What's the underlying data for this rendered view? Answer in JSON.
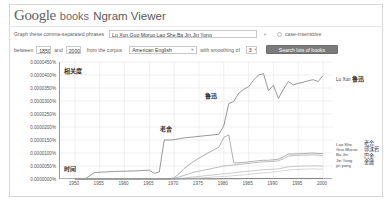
{
  "header": {
    "logo_google": "Google",
    "logo_books": "books",
    "logo_ngram": "Ngram Viewer"
  },
  "form": {
    "phrases_label": "Graph these comma-separated phrases",
    "phrases_value": "Lu Xun,Guo Moruo,Lao She,Ba Jin,Jin Yong",
    "case_insensitive_label": "case-insensitive",
    "between_label": "between",
    "year_start": "1850",
    "and_label": "and",
    "year_end": "2000",
    "corpus_label": "from the corpus",
    "corpus_value": "American English",
    "smoothing_label": "with smoothing of",
    "smoothing_value": "3",
    "search_button": "Search lots of books"
  },
  "annotations": {
    "y_axis_cn": "相关度",
    "x_axis_cn": "时间",
    "lao_she_cn": "老舍",
    "lu_xun_cn": "鲁迅"
  },
  "legend_right": {
    "top": {
      "name": "Lu Xun",
      "cn": "鲁迅"
    },
    "items": [
      {
        "name": "Lao She",
        "cn": "老舍"
      },
      {
        "name": "Guo Moruo",
        "cn": "郭沫若"
      },
      {
        "name": "Ba Jin",
        "cn": "巴金"
      },
      {
        "name": "Jin Yong",
        "cn": "金庸"
      },
      {
        "name": "jin yong",
        "cn": ""
      }
    ]
  },
  "chart_data": {
    "type": "line",
    "title": "",
    "xlabel": "时间",
    "ylabel": "相关度",
    "xlim": [
      1947,
      2002
    ],
    "ylim": [
      0.0,
      4.5e-05
    ],
    "grid": true,
    "legend_position": "right",
    "ytick_labels": [
      "0.0000450%",
      "0.0000400%",
      "0.0000350%",
      "0.0000300%",
      "0.0000250%",
      "0.0000200%",
      "0.0000150%",
      "0.0000100%",
      "0.0000050%",
      "0.0000000%"
    ],
    "ytick_values": [
      4.5e-05,
      4e-05,
      3.5e-05,
      3e-05,
      2.5e-05,
      2e-05,
      1.5e-05,
      1e-05,
      5e-06,
      0.0
    ],
    "xtick_labels": [
      "1950",
      "1955",
      "1960",
      "1965",
      "1970",
      "1975",
      "1980",
      "1985",
      "1990",
      "1995",
      "2000"
    ],
    "xtick_values": [
      1950,
      1955,
      1960,
      1965,
      1970,
      1975,
      1980,
      1985,
      1990,
      1995,
      2000
    ],
    "x": [
      1950,
      1952,
      1954,
      1955,
      1956,
      1958,
      1960,
      1962,
      1964,
      1965,
      1966,
      1967,
      1968,
      1969,
      1970,
      1971,
      1972,
      1973,
      1974,
      1975,
      1976,
      1977,
      1978,
      1979,
      1980,
      1981,
      1982,
      1983,
      1984,
      1985,
      1986,
      1987,
      1988,
      1989,
      1990,
      1991,
      1992,
      1993,
      1994,
      1995,
      1996,
      1997,
      1998,
      1999,
      2000
    ],
    "series": [
      {
        "name": "Lu Xun",
        "cn": "鲁迅",
        "color": "#6b6b6b",
        "values": [
          0.0,
          0.0,
          2.5e-06,
          2.6e-06,
          2.7e-06,
          2.9e-06,
          3e-06,
          3.1e-06,
          3.3e-06,
          3.4e-06,
          2.2e-06,
          2.7e-06,
          1.5e-05,
          1.5e-05,
          1.51e-05,
          1.55e-05,
          1.58e-05,
          1.6e-05,
          1.62e-05,
          1.64e-05,
          1.66e-05,
          1.68e-05,
          1.7e-05,
          1.72e-05,
          2.05e-05,
          2.9e-05,
          2.98e-05,
          3.3e-05,
          3.45e-05,
          3.55e-05,
          3.8e-05,
          4e-05,
          4.05e-05,
          3.4e-05,
          3.6e-05,
          3.1e-05,
          3.45e-05,
          3.75e-05,
          3.62e-05,
          3.68e-05,
          3.72e-05,
          3.78e-05,
          3.82e-05,
          3.75e-05,
          3.98e-05
        ]
      },
      {
        "name": "Lao She",
        "cn": "老舍",
        "color": "#8c8c8c",
        "values": [
          0.0,
          0.0,
          0.0,
          0.0,
          0.0,
          0.0,
          0.0,
          0.0,
          0.0,
          0.0,
          0.0,
          0.0,
          0.0,
          0.0,
          5e-07,
          2e-06,
          4e-06,
          5.5e-06,
          6.8e-06,
          8e-06,
          9.2e-06,
          1.02e-05,
          1.12e-05,
          1.22e-05,
          1.6e-05,
          1.7e-05,
          6.2e-06,
          6.2e-06,
          6.4e-06,
          6.6e-06,
          6.8e-06,
          7e-06,
          7.2e-06,
          7.2e-06,
          7.4e-06,
          7.6e-06,
          8.5e-06,
          9.6e-06,
          9.6e-06,
          9.7e-06,
          9.8e-06,
          9.9e-06,
          1e-05,
          9.8e-06,
          9.8e-06
        ]
      },
      {
        "name": "Guo Moruo",
        "cn": "郭沫若",
        "color": "#a0a0a0",
        "values": [
          0.0,
          0.0,
          0.0,
          0.0,
          0.0,
          0.0,
          0.0,
          0.0,
          0.0,
          0.0,
          0.0,
          0.0,
          0.0,
          0.0,
          2e-07,
          8e-07,
          1.4e-06,
          2e-06,
          2.6e-06,
          3e-06,
          3.4e-06,
          3.8e-06,
          4.2e-06,
          4.6e-06,
          5e-06,
          5.2e-06,
          5.4e-06,
          5.6e-06,
          5.8e-06,
          6e-06,
          6.2e-06,
          6.4e-06,
          6.6e-06,
          6.6e-06,
          6.8e-06,
          7e-06,
          7.8e-06,
          8.8e-06,
          9e-06,
          9.1e-06,
          9.2e-06,
          9.2e-06,
          9.3e-06,
          9.2e-06,
          9e-06
        ]
      },
      {
        "name": "Ba Jin",
        "cn": "巴金",
        "color": "#b4b4b4",
        "values": [
          0.0,
          0.0,
          0.0,
          0.0,
          0.0,
          0.0,
          0.0,
          0.0,
          0.0,
          0.0,
          0.0,
          0.0,
          0.0,
          0.0,
          0.0,
          2e-07,
          4e-07,
          6e-07,
          8e-07,
          1e-06,
          1.2e-06,
          1.4e-06,
          1.6e-06,
          1.8e-06,
          2e-06,
          2.2e-06,
          2.4e-06,
          2.6e-06,
          2.8e-06,
          3e-06,
          3.2e-06,
          3.4e-06,
          3.6e-06,
          3.6e-06,
          3.8e-06,
          3.9e-06,
          4.3e-06,
          4.7e-06,
          4.8e-06,
          4.9e-06,
          5e-06,
          5e-06,
          5.1e-06,
          5e-06,
          5e-06
        ]
      },
      {
        "name": "Jin Yong",
        "cn": "金庸",
        "color": "#c4c4c4",
        "values": [
          0.0,
          0.0,
          0.0,
          0.0,
          0.0,
          0.0,
          0.0,
          0.0,
          0.0,
          0.0,
          0.0,
          0.0,
          0.0,
          0.0,
          0.0,
          0.0,
          1e-07,
          2e-07,
          3e-07,
          4e-07,
          5e-07,
          6e-07,
          8e-07,
          9e-07,
          1e-06,
          1.1e-06,
          1.3e-06,
          1.4e-06,
          1.6e-06,
          1.8e-06,
          2e-06,
          2.2e-06,
          2.4e-06,
          2.5e-06,
          2.7e-06,
          2.9e-06,
          3.2e-06,
          3.5e-06,
          3.6e-06,
          3.7e-06,
          3.8e-06,
          3.8e-06,
          3.9e-06,
          3.8e-06,
          3.8e-06
        ]
      },
      {
        "name": "jin yong",
        "cn": "",
        "color": "#707070",
        "values": [
          0.0,
          0.0,
          0.0,
          0.0,
          0.0,
          0.0,
          0.0,
          0.0,
          0.0,
          0.0,
          0.0,
          0.0,
          0.0,
          0.0,
          0.0,
          0.0,
          0.0,
          0.0,
          0.0,
          0.0,
          0.0,
          0.0,
          0.0,
          0.0,
          1e-07,
          1e-07,
          1e-07,
          1e-07,
          2e-07,
          2e-07,
          2e-07,
          2e-07,
          2e-07,
          2e-07,
          2e-07,
          2e-07,
          2e-07,
          2e-07,
          2e-07,
          2e-07,
          2e-07,
          2e-07,
          2e-07,
          2e-07,
          2e-07
        ]
      }
    ]
  }
}
